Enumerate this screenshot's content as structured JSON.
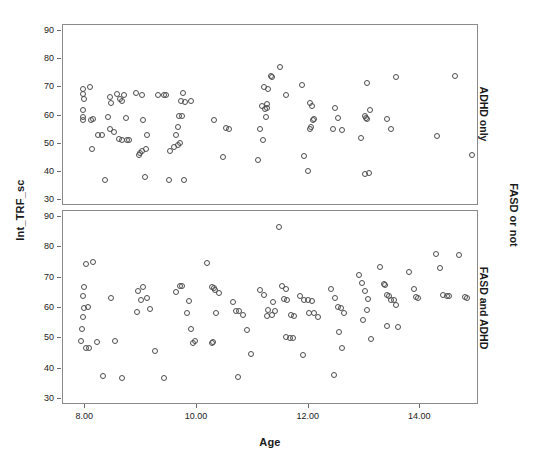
{
  "figure": {
    "y_axis_title": "Int_TRF_sc",
    "x_axis_title": "Age",
    "group_title": "FASD or not",
    "panel_top_label": "ADHD only",
    "panel_bottom_label": "FASD and ADHD"
  },
  "chart_data": {
    "type": "scatter",
    "title": "",
    "xlabel": "Age",
    "ylabel": "Int_TRF_sc",
    "xlim": [
      7.6,
      15.05
    ],
    "ylim": [
      28,
      92
    ],
    "xticks": [
      8,
      10,
      12,
      14
    ],
    "xtick_labels": [
      "8.00",
      "10.00",
      "12.00",
      "14.00"
    ],
    "yticks": [
      30,
      40,
      50,
      60,
      70,
      80,
      90
    ],
    "ytick_labels": [
      "30",
      "40",
      "50",
      "60",
      "70",
      "80",
      "90"
    ],
    "grid": false,
    "legend": "none",
    "panel_variable": "FASD or not",
    "marker": "open-circle",
    "marker_color": "#4d4d4d",
    "panels": [
      {
        "label": "ADHD only",
        "points": [
          [
            7.95,
            69.5
          ],
          [
            7.95,
            67.5
          ],
          [
            7.98,
            66.0
          ],
          [
            8.08,
            70.0
          ],
          [
            7.95,
            62.0
          ],
          [
            7.95,
            59.5
          ],
          [
            7.96,
            58.5
          ],
          [
            8.1,
            58.5
          ],
          [
            8.14,
            58.6
          ],
          [
            8.12,
            48.2
          ],
          [
            8.22,
            53.0
          ],
          [
            8.4,
            59.3
          ],
          [
            8.45,
            66.5
          ],
          [
            8.46,
            64.5
          ],
          [
            8.56,
            67.5
          ],
          [
            8.62,
            66.0
          ],
          [
            8.7,
            67.3
          ],
          [
            8.66,
            65.0
          ],
          [
            8.72,
            59.0
          ],
          [
            8.45,
            55.2
          ],
          [
            8.52,
            54.3
          ],
          [
            8.6,
            51.8
          ],
          [
            8.66,
            51.3
          ],
          [
            8.74,
            51.2
          ],
          [
            8.78,
            51.2
          ],
          [
            8.3,
            53.1
          ],
          [
            8.36,
            37.3
          ],
          [
            8.9,
            68.0
          ],
          [
            9.02,
            67.2
          ],
          [
            9.04,
            58.4
          ],
          [
            9.3,
            67.2
          ],
          [
            9.4,
            67.3
          ],
          [
            9.44,
            67.2
          ],
          [
            9.1,
            53.2
          ],
          [
            9.08,
            48.3
          ],
          [
            9.02,
            47.6
          ],
          [
            8.98,
            46.6
          ],
          [
            8.96,
            45.9
          ],
          [
            9.06,
            38.3
          ],
          [
            9.75,
            67.8
          ],
          [
            9.72,
            65.2
          ],
          [
            9.78,
            64.8
          ],
          [
            9.9,
            65.3
          ],
          [
            9.74,
            60.0
          ],
          [
            9.68,
            59.8
          ],
          [
            9.66,
            55.8
          ],
          [
            9.62,
            53.2
          ],
          [
            9.52,
            47.3
          ],
          [
            9.58,
            48.8
          ],
          [
            9.66,
            49.5
          ],
          [
            9.7,
            50.2
          ],
          [
            9.5,
            37.2
          ],
          [
            9.76,
            37.3
          ],
          [
            10.3,
            58.3
          ],
          [
            10.52,
            55.5
          ],
          [
            10.58,
            55.4
          ],
          [
            10.46,
            45.2
          ],
          [
            11.2,
            70.2
          ],
          [
            11.28,
            69.2
          ],
          [
            11.32,
            73.8
          ],
          [
            11.34,
            73.6
          ],
          [
            11.48,
            77.3
          ],
          [
            11.16,
            63.5
          ],
          [
            11.22,
            62.2
          ],
          [
            11.26,
            64.2
          ],
          [
            11.12,
            55.3
          ],
          [
            11.18,
            51.2
          ],
          [
            11.24,
            59.6
          ],
          [
            11.26,
            62.5
          ],
          [
            11.1,
            44.3
          ],
          [
            11.6,
            67.2
          ],
          [
            11.88,
            70.8
          ],
          [
            12.02,
            64.5
          ],
          [
            12.06,
            63.2
          ],
          [
            12.1,
            58.6
          ],
          [
            12.08,
            58.5
          ],
          [
            12.04,
            56.0
          ],
          [
            12.02,
            55.4
          ],
          [
            11.92,
            45.8
          ],
          [
            11.98,
            40.5
          ],
          [
            12.48,
            62.8
          ],
          [
            12.52,
            59.2
          ],
          [
            12.44,
            55.2
          ],
          [
            12.6,
            54.8
          ],
          [
            13.05,
            71.5
          ],
          [
            13.1,
            62.0
          ],
          [
            13.0,
            59.8
          ],
          [
            13.02,
            59.2
          ],
          [
            13.04,
            58.6
          ],
          [
            12.94,
            52.2
          ],
          [
            13.0,
            39.4
          ],
          [
            13.08,
            39.5
          ],
          [
            13.4,
            58.8
          ],
          [
            13.48,
            55.2
          ],
          [
            13.56,
            73.6
          ],
          [
            14.3,
            52.8
          ],
          [
            14.62,
            74.0
          ],
          [
            14.92,
            46.2
          ]
        ]
      },
      {
        "label": "FASD and ADHD",
        "points": [
          [
            8.02,
            74.5
          ],
          [
            8.14,
            75.2
          ],
          [
            7.98,
            67.0
          ],
          [
            7.96,
            64.0
          ],
          [
            7.98,
            60.0
          ],
          [
            8.04,
            60.2
          ],
          [
            7.96,
            57.0
          ],
          [
            7.94,
            53.2
          ],
          [
            7.92,
            49.0
          ],
          [
            8.02,
            46.8
          ],
          [
            8.06,
            46.7
          ],
          [
            8.2,
            48.8
          ],
          [
            8.32,
            37.5
          ],
          [
            8.46,
            63.2
          ],
          [
            8.54,
            49.2
          ],
          [
            8.66,
            36.9
          ],
          [
            8.94,
            65.5
          ],
          [
            9.04,
            67.0
          ],
          [
            9.0,
            62.8
          ],
          [
            8.92,
            58.8
          ],
          [
            9.1,
            63.2
          ],
          [
            9.16,
            59.8
          ],
          [
            9.24,
            45.7
          ],
          [
            9.4,
            36.8
          ],
          [
            9.62,
            65.2
          ],
          [
            9.7,
            67.4
          ],
          [
            9.74,
            67.2
          ],
          [
            9.86,
            62.2
          ],
          [
            9.82,
            58.4
          ],
          [
            9.9,
            53.0
          ],
          [
            9.96,
            49.2
          ],
          [
            9.92,
            48.5
          ],
          [
            10.18,
            74.8
          ],
          [
            10.26,
            66.8
          ],
          [
            10.3,
            66.6
          ],
          [
            10.32,
            65.9
          ],
          [
            10.4,
            64.8
          ],
          [
            10.34,
            58.5
          ],
          [
            10.28,
            48.8
          ],
          [
            10.26,
            48.3
          ],
          [
            10.64,
            62.0
          ],
          [
            10.7,
            59.0
          ],
          [
            10.76,
            58.9
          ],
          [
            10.82,
            57.8
          ],
          [
            10.9,
            52.8
          ],
          [
            10.96,
            44.8
          ],
          [
            10.74,
            37.2
          ],
          [
            11.12,
            65.8
          ],
          [
            11.2,
            64.3
          ],
          [
            11.28,
            59.2
          ],
          [
            11.34,
            57.8
          ],
          [
            11.26,
            57.2
          ],
          [
            11.36,
            62.0
          ],
          [
            11.4,
            58.9
          ],
          [
            11.46,
            86.8
          ],
          [
            11.52,
            67.2
          ],
          [
            11.6,
            66.2
          ],
          [
            11.56,
            63.0
          ],
          [
            11.62,
            62.5
          ],
          [
            11.68,
            57.6
          ],
          [
            11.74,
            57.5
          ],
          [
            11.6,
            50.3
          ],
          [
            11.66,
            50.2
          ],
          [
            11.72,
            50.1
          ],
          [
            11.84,
            64.0
          ],
          [
            11.92,
            62.6
          ],
          [
            11.98,
            62.5
          ],
          [
            12.06,
            62.4
          ],
          [
            12.0,
            58.3
          ],
          [
            12.1,
            58.2
          ],
          [
            12.16,
            57.0
          ],
          [
            11.9,
            44.5
          ],
          [
            12.4,
            66.2
          ],
          [
            12.48,
            63.4
          ],
          [
            12.52,
            60.2
          ],
          [
            12.58,
            60.0
          ],
          [
            12.64,
            58.3
          ],
          [
            12.54,
            52.0
          ],
          [
            12.6,
            46.9
          ],
          [
            12.46,
            38.0
          ],
          [
            12.9,
            71.0
          ],
          [
            12.96,
            68.2
          ],
          [
            13.0,
            65.5
          ],
          [
            13.06,
            63.0
          ],
          [
            13.04,
            59.5
          ],
          [
            12.98,
            56.0
          ],
          [
            13.12,
            49.8
          ],
          [
            13.28,
            73.5
          ],
          [
            13.34,
            68.0
          ],
          [
            13.36,
            67.6
          ],
          [
            13.4,
            64.2
          ],
          [
            13.44,
            63.8
          ],
          [
            13.48,
            62.8
          ],
          [
            13.52,
            62.5
          ],
          [
            13.56,
            61.0
          ],
          [
            13.6,
            53.8
          ],
          [
            13.4,
            54.2
          ],
          [
            13.8,
            72.0
          ],
          [
            13.88,
            66.4
          ],
          [
            13.92,
            63.6
          ],
          [
            13.96,
            63.2
          ],
          [
            14.28,
            77.8
          ],
          [
            14.36,
            73.2
          ],
          [
            14.4,
            64.2
          ],
          [
            14.48,
            64.0
          ],
          [
            14.52,
            63.8
          ],
          [
            14.7,
            77.5
          ],
          [
            14.8,
            63.5
          ],
          [
            14.84,
            63.4
          ]
        ]
      }
    ]
  }
}
